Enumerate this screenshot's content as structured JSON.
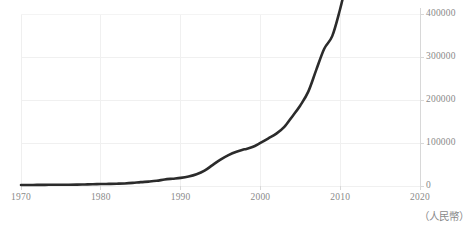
{
  "chart_data": {
    "type": "line",
    "title": "",
    "subtitle": "",
    "xlabel": "",
    "ylabel": "",
    "unit_note": "（人民幣）",
    "grid": true,
    "legend": null,
    "legend_position": "none",
    "y_axis_position": "right",
    "xlim": [
      1970,
      2020
    ],
    "ylim": [
      0,
      400000
    ],
    "xticks": [
      1970,
      1980,
      1990,
      2000,
      2010,
      2020
    ],
    "xtick_labels": [
      "1970",
      "1980",
      "1990",
      "2000",
      "2010",
      "2020"
    ],
    "yticks": [
      0,
      100000,
      200000,
      300000,
      400000
    ],
    "ytick_labels": [
      "0",
      "100000",
      "200000",
      "300000",
      "400000"
    ],
    "line_color": "#2b2b2b",
    "line_width": 2.6,
    "grid_color": "#f0f0f0",
    "axis_color": "#d8d8d8",
    "tick_text_color": "#8a8a8a",
    "series": [
      {
        "name": "GDP",
        "x": [
          1970,
          1971,
          1972,
          1973,
          1974,
          1975,
          1976,
          1977,
          1978,
          1979,
          1980,
          1981,
          1982,
          1983,
          1984,
          1985,
          1986,
          1987,
          1988,
          1989,
          1990,
          1991,
          1992,
          1993,
          1994,
          1995,
          1996,
          1997,
          1998,
          1999,
          2000,
          2001,
          2002,
          2003,
          2004,
          2005,
          2006,
          2007,
          2008,
          2009,
          2010,
          2011,
          2012,
          2013,
          2014,
          2015,
          2016,
          2017,
          2018,
          2019
        ],
        "values": [
          2253,
          2426,
          2519,
          2721,
          2790,
          3013,
          2944,
          3201,
          3624,
          4038,
          4546,
          4892,
          5323,
          5963,
          7208,
          9016,
          10275,
          12059,
          15043,
          17001,
          18873,
          22006,
          27195,
          35674,
          48638,
          61340,
          71814,
          79715,
          85196,
          90564,
          100280,
          110863,
          121717,
          137422,
          161840,
          187319,
          219439,
          270092,
          319245,
          348518,
          412119,
          487940,
          538580,
          592963,
          643563,
          688858,
          746395,
          832036,
          919281,
          986515
        ]
      }
    ]
  }
}
